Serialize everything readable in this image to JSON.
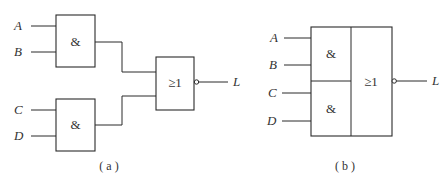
{
  "diagram_a": {
    "caption": "( a )",
    "inputs": [
      "A",
      "B",
      "C",
      "D"
    ],
    "gate_and_1_symbol": "&",
    "gate_and_2_symbol": "&",
    "gate_or_symbol": "≥1",
    "output": "L"
  },
  "diagram_b": {
    "caption": "( b )",
    "inputs": [
      "A",
      "B",
      "C",
      "D"
    ],
    "and_upper_symbol": "&",
    "and_lower_symbol": "&",
    "or_symbol": "≥1",
    "output": "L"
  }
}
